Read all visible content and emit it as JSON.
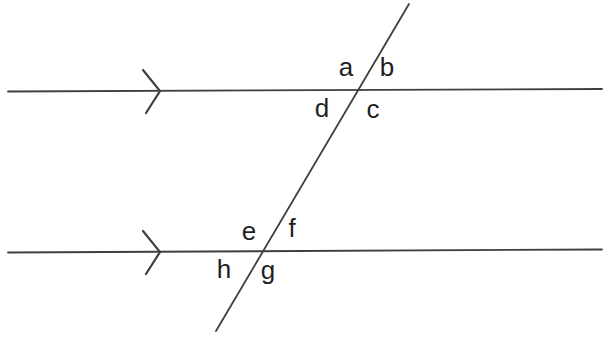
{
  "figure": {
    "angle_labels": {
      "a": "a",
      "b": "b",
      "c": "c",
      "d": "d",
      "e": "e",
      "f": "f",
      "g": "g",
      "h": "h"
    },
    "label_layout": {
      "top_intersection": [
        "a above-left",
        "b above-right",
        "d below-left",
        "c below-right"
      ],
      "bottom_intersection": [
        "e above-left",
        "f above-right",
        "h below-left",
        "g below-right"
      ]
    },
    "parallel_marks": "single chevron arrow on each parallel line"
  },
  "colors": {
    "line": "#3f3f3f",
    "label": "#1f1f1f",
    "background": "#ffffff"
  }
}
